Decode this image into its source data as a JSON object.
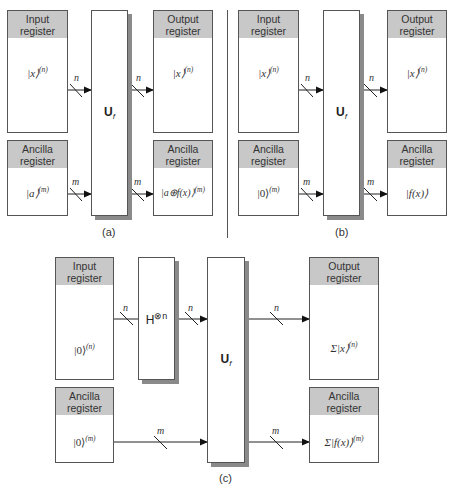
{
  "panels": {
    "a": {
      "caption": "(a)",
      "input_register": {
        "title_line1": "Input",
        "title_line2": "register",
        "state": "|x⟩",
        "exp": "(n)"
      },
      "ancilla_register": {
        "title_line1": "Ancilla",
        "title_line2": "register",
        "state": "|a⟩",
        "exp": "(m)"
      },
      "gate": {
        "label": "U",
        "sub": "f"
      },
      "output_register": {
        "title_line1": "Output",
        "title_line2": "register",
        "state": "|x⟩",
        "exp": "(n)"
      },
      "output_ancilla": {
        "title_line1": "Ancilla",
        "title_line2": "register",
        "state": "|a⊕f(x)⟩",
        "exp": "(m)"
      },
      "wire_labels": {
        "in_n": "n",
        "in_m": "m",
        "out_n": "n",
        "out_m": "m"
      }
    },
    "b": {
      "caption": "(b)",
      "input_register": {
        "title_line1": "Input",
        "title_line2": "register",
        "state": "|x⟩",
        "exp": "(n)"
      },
      "ancilla_register": {
        "title_line1": "Ancilla",
        "title_line2": "register",
        "state": "|0⟩",
        "exp": "(m)"
      },
      "gate": {
        "label": "U",
        "sub": "f"
      },
      "output_register": {
        "title_line1": "Output",
        "title_line2": "register",
        "state": "|x⟩",
        "exp": "(n)"
      },
      "output_ancilla": {
        "title_line1": "Ancilla",
        "title_line2": "register",
        "state": "|f(x)⟩",
        "exp": ""
      },
      "wire_labels": {
        "in_n": "n",
        "in_m": "m",
        "out_n": "n",
        "out_m": "m"
      }
    },
    "c": {
      "caption": "(c)",
      "input_register": {
        "title_line1": "Input",
        "title_line2": "register",
        "state": "|0⟩",
        "exp": "(n)"
      },
      "ancilla_register": {
        "title_line1": "Ancilla",
        "title_line2": "register",
        "state": "|0⟩",
        "exp": "(m)"
      },
      "hadamard": {
        "label": "H",
        "sup": "⊗n"
      },
      "gate": {
        "label": "U",
        "sub": "f"
      },
      "output_register": {
        "title_line1": "Output",
        "title_line2": "register",
        "state": "Σ|x⟩",
        "exp": "(n)"
      },
      "output_ancilla": {
        "title_line1": "Ancilla",
        "title_line2": "register",
        "state": "Σ|f(x)⟩",
        "exp": "(m)"
      },
      "wire_labels": {
        "in_n": "n",
        "mid_n": "n",
        "in_m": "m",
        "out_n": "n",
        "out_m": "m"
      }
    }
  },
  "colors": {
    "header": "#c8c8c8",
    "border": "#555555",
    "shadow": "#8a8a8a"
  }
}
